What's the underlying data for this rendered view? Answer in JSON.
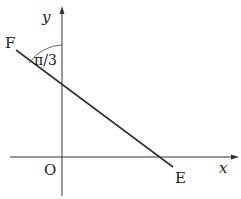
{
  "diagram": {
    "axes": {
      "x_label": "x",
      "y_label": "y",
      "origin_label": "O"
    },
    "points": {
      "start_label": "F",
      "end_label": "E"
    },
    "angle_label": "π/3",
    "colors": {
      "stroke": "#333333",
      "background": "#ffffff"
    }
  }
}
